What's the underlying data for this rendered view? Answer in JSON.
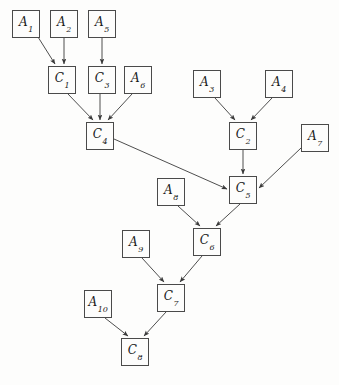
{
  "diagram": {
    "canvas": {
      "width": 339,
      "height": 385
    },
    "style": {
      "background_color": "#fdfdfc",
      "node_fill": "#fdfdfc",
      "node_border_color": "#4a4a4a",
      "edge_color": "#3a3a3a",
      "text_color": "#1a1a1a",
      "node_width": 28,
      "node_height": 28
    },
    "nodes": [
      {
        "id": "A1",
        "base": "A",
        "sub": "1",
        "label": "A1",
        "x": 12,
        "y": 10
      },
      {
        "id": "A2",
        "base": "A",
        "sub": "2",
        "label": "A2",
        "x": 50,
        "y": 10
      },
      {
        "id": "A5",
        "base": "A",
        "sub": "5",
        "label": "A5",
        "x": 88,
        "y": 10
      },
      {
        "id": "C1",
        "base": "C",
        "sub": "1",
        "label": "C1",
        "x": 48,
        "y": 66
      },
      {
        "id": "C3",
        "base": "C",
        "sub": "3",
        "label": "C3",
        "x": 88,
        "y": 66
      },
      {
        "id": "A6",
        "base": "A",
        "sub": "6",
        "label": "A6",
        "x": 124,
        "y": 66
      },
      {
        "id": "A3",
        "base": "A",
        "sub": "3",
        "label": "A3",
        "x": 193,
        "y": 70
      },
      {
        "id": "A4",
        "base": "A",
        "sub": "4",
        "label": "A4",
        "x": 265,
        "y": 70
      },
      {
        "id": "C4",
        "base": "C",
        "sub": "4",
        "label": "C4",
        "x": 86,
        "y": 122
      },
      {
        "id": "C2",
        "base": "C",
        "sub": "2",
        "label": "C2",
        "x": 229,
        "y": 122
      },
      {
        "id": "A7",
        "base": "A",
        "sub": "7",
        "label": "A7",
        "x": 301,
        "y": 124
      },
      {
        "id": "A8",
        "base": "A",
        "sub": "8",
        "label": "A8",
        "x": 157,
        "y": 178
      },
      {
        "id": "C5",
        "base": "C",
        "sub": "5",
        "label": "C5",
        "x": 229,
        "y": 176
      },
      {
        "id": "A9",
        "base": "A",
        "sub": "9",
        "label": "A9",
        "x": 122,
        "y": 230
      },
      {
        "id": "C6",
        "base": "C",
        "sub": "6",
        "label": "C6",
        "x": 193,
        "y": 228
      },
      {
        "id": "A10",
        "base": "A",
        "sub": "10",
        "label": "A10",
        "x": 84,
        "y": 290
      },
      {
        "id": "C7",
        "base": "C",
        "sub": "7",
        "label": "C7",
        "x": 157,
        "y": 284
      },
      {
        "id": "C8",
        "base": "C",
        "sub": "8",
        "label": "C8",
        "x": 121,
        "y": 338
      }
    ],
    "edges": [
      {
        "from": "A1",
        "to": "C1",
        "x1": 38,
        "y1": 37,
        "x2": 55,
        "y2": 64
      },
      {
        "from": "A2",
        "to": "C1",
        "x1": 64,
        "y1": 38,
        "x2": 64,
        "y2": 64
      },
      {
        "from": "A5",
        "to": "C3",
        "x1": 102,
        "y1": 38,
        "x2": 102,
        "y2": 64
      },
      {
        "from": "C1",
        "to": "C4",
        "x1": 68,
        "y1": 94,
        "x2": 93,
        "y2": 120
      },
      {
        "from": "C3",
        "to": "C4",
        "x1": 100,
        "y1": 94,
        "x2": 100,
        "y2": 120
      },
      {
        "from": "A6",
        "to": "C4",
        "x1": 132,
        "y1": 94,
        "x2": 108,
        "y2": 120
      },
      {
        "from": "A3",
        "to": "C2",
        "x1": 215,
        "y1": 98,
        "x2": 235,
        "y2": 120
      },
      {
        "from": "A4",
        "to": "C2",
        "x1": 272,
        "y1": 98,
        "x2": 251,
        "y2": 120
      },
      {
        "from": "C4",
        "to": "C5",
        "x1": 114,
        "y1": 139,
        "x2": 227,
        "y2": 189
      },
      {
        "from": "C2",
        "to": "C5",
        "x1": 243,
        "y1": 150,
        "x2": 243,
        "y2": 174
      },
      {
        "from": "A7",
        "to": "C5",
        "x1": 301,
        "y1": 148,
        "x2": 259,
        "y2": 188
      },
      {
        "from": "A8",
        "to": "C6",
        "x1": 178,
        "y1": 206,
        "x2": 200,
        "y2": 226
      },
      {
        "from": "C5",
        "to": "C6",
        "x1": 240,
        "y1": 204,
        "x2": 216,
        "y2": 226
      },
      {
        "from": "A9",
        "to": "C7",
        "x1": 142,
        "y1": 258,
        "x2": 164,
        "y2": 282
      },
      {
        "from": "C6",
        "to": "C7",
        "x1": 202,
        "y1": 256,
        "x2": 180,
        "y2": 282
      },
      {
        "from": "A10",
        "to": "C8",
        "x1": 105,
        "y1": 318,
        "x2": 128,
        "y2": 336
      },
      {
        "from": "C7",
        "to": "C8",
        "x1": 166,
        "y1": 312,
        "x2": 144,
        "y2": 336
      }
    ]
  }
}
